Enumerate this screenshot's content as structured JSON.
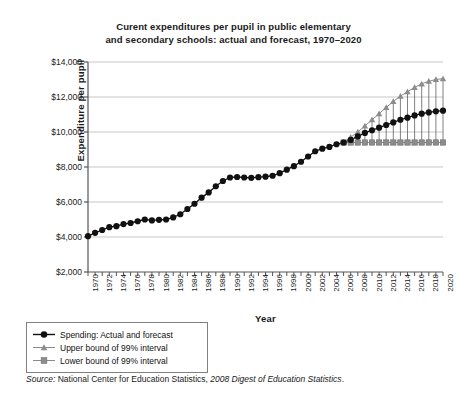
{
  "chart_data": {
    "type": "line",
    "title": "Curent expenditures per pupil in public elementary and secondary schools: actual and forecast, 1970–2020",
    "title_line1": "Curent expenditures per pupil in public elementary",
    "title_line2": "and secondary schools: actual and forecast, 1970–2020",
    "xlabel": "Year",
    "ylabel": "Expenditure per pupil",
    "ylim": [
      2000,
      14000
    ],
    "xlim": [
      1970,
      2020
    ],
    "y_ticks": [
      2000,
      4000,
      6000,
      8000,
      10000,
      12000,
      14000
    ],
    "y_tick_labels": [
      "$2,000",
      "$4,000",
      "$6,000",
      "$8,000",
      "$10,000",
      "$12,000",
      "$14,000"
    ],
    "x_ticks": [
      1970,
      1972,
      1974,
      1976,
      1978,
      1980,
      1982,
      1984,
      1986,
      1988,
      1990,
      1992,
      1994,
      1996,
      1998,
      2000,
      2002,
      2004,
      2006,
      2008,
      2010,
      2012,
      2014,
      2016,
      2018,
      2020
    ],
    "x_tick_labels": [
      "1970",
      "1972",
      "1974",
      "1976",
      "1978",
      "1980",
      "1982",
      "1984",
      "1986",
      "1988",
      "1990",
      "1992",
      "1994",
      "1996",
      "1998",
      "2000",
      "2002",
      "2004",
      "2006",
      "2008",
      "2010",
      "2012",
      "2014",
      "2016",
      "2018",
      "2020"
    ],
    "grid": "horizontal",
    "legend_position": "below-left-outside",
    "forecast_start_year": 2007,
    "x": [
      1970,
      1971,
      1972,
      1973,
      1974,
      1975,
      1976,
      1977,
      1978,
      1979,
      1980,
      1981,
      1982,
      1983,
      1984,
      1985,
      1986,
      1987,
      1988,
      1989,
      1990,
      1991,
      1992,
      1993,
      1994,
      1995,
      1996,
      1997,
      1998,
      1999,
      2000,
      2001,
      2002,
      2003,
      2004,
      2005,
      2006,
      2007,
      2008,
      2009,
      2010,
      2011,
      2012,
      2013,
      2014,
      2015,
      2016,
      2017,
      2018,
      2019,
      2020
    ],
    "series": [
      {
        "name": "Spending: Actual and forecast",
        "marker": "circle",
        "color": "#111111",
        "values": [
          4050,
          4240,
          4400,
          4560,
          4620,
          4740,
          4800,
          4900,
          5000,
          4950,
          4980,
          5000,
          5120,
          5300,
          5600,
          5900,
          6250,
          6550,
          6900,
          7200,
          7400,
          7430,
          7400,
          7380,
          7420,
          7450,
          7500,
          7650,
          7850,
          8050,
          8300,
          8600,
          8900,
          9050,
          9150,
          9300,
          9400,
          9550,
          9750,
          9950,
          10100,
          10250,
          10400,
          10550,
          10700,
          10820,
          10950,
          11050,
          11120,
          11180,
          11220
        ]
      },
      {
        "name": "Upper bound of 99% interval",
        "marker": "triangle",
        "color": "#8c8c8c",
        "values": [
          null,
          null,
          null,
          null,
          null,
          null,
          null,
          null,
          null,
          null,
          null,
          null,
          null,
          null,
          null,
          null,
          null,
          null,
          null,
          null,
          null,
          null,
          null,
          null,
          null,
          null,
          null,
          null,
          null,
          null,
          null,
          null,
          null,
          null,
          null,
          null,
          9400,
          9700,
          10000,
          10350,
          10700,
          11050,
          11400,
          11750,
          12050,
          12300,
          12550,
          12750,
          12900,
          13000,
          13050
        ]
      },
      {
        "name": "Lower bound of 99% interval",
        "marker": "square",
        "color": "#8c8c8c",
        "values": [
          null,
          null,
          null,
          null,
          null,
          null,
          null,
          null,
          null,
          null,
          null,
          null,
          null,
          null,
          null,
          null,
          null,
          null,
          null,
          null,
          null,
          null,
          null,
          null,
          null,
          null,
          null,
          null,
          null,
          null,
          null,
          null,
          null,
          null,
          null,
          null,
          9400,
          9400,
          9400,
          9400,
          9400,
          9400,
          9400,
          9400,
          9400,
          9400,
          9400,
          9400,
          9400,
          9400,
          9400
        ]
      }
    ]
  },
  "legend": {
    "items": [
      {
        "label": "Spending: Actual and forecast",
        "marker": "circle",
        "color": "#111111"
      },
      {
        "label": "Upper bound of 99% interval",
        "marker": "triangle",
        "color": "#8c8c8c"
      },
      {
        "label": "Lower bound of 99% interval",
        "marker": "square",
        "color": "#8c8c8c"
      }
    ]
  },
  "source": {
    "label": "Source:",
    "body": " National Center for Education Statistics, ",
    "italic_part": "2008 Digest of Education Statistics",
    "end": "."
  }
}
